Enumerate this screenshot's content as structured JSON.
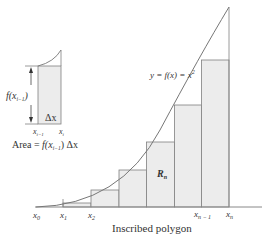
{
  "diagram": {
    "title": "Inscribed polygon",
    "curve_label": "y = f(x) = x²",
    "curve_label_parts": {
      "y": "y",
      "eq1": " = ",
      "f": "f",
      "x": "(x)",
      "eq2": " = ",
      "x2": "x",
      "exp": "2"
    },
    "region_label": "R",
    "region_sub": "n",
    "x_labels": [
      {
        "base": "x",
        "sub": "0"
      },
      {
        "base": "x",
        "sub": "1"
      },
      {
        "base": "x",
        "sub": "2"
      },
      {
        "base": "x",
        "sub": "n − 1"
      },
      {
        "base": "x",
        "sub": "n"
      }
    ],
    "inset": {
      "height_label_f": "f(x",
      "height_label_sub": "i−1",
      "height_label_close": ")",
      "width_label": "Δx",
      "left_label": {
        "base": "x",
        "sub": "i−1"
      },
      "right_label": {
        "base": "x",
        "sub": "i"
      },
      "area_formula_prefix": "Area = ",
      "area_formula_f": "f",
      "area_formula_arg": "(x",
      "area_formula_sub": "i−1",
      "area_formula_close": ") Δx"
    },
    "colors": {
      "rect_fill": "#ececec",
      "line": "#777777",
      "text": "#333333"
    }
  }
}
